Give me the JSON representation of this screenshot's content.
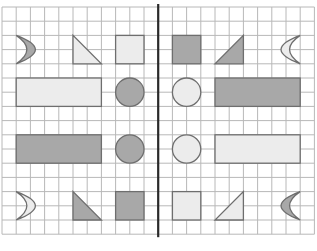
{
  "grid": {
    "x0": 2,
    "y0": 7,
    "cols": 22,
    "rows": 16,
    "cell": 14.2,
    "line_color": "#b8b8b8",
    "divider_color": "#2a2a2a",
    "divider_col": 11
  },
  "colors": {
    "dark_fill": "#a8a8a8",
    "light_fill": "#ececec",
    "stroke": "#6e6e6e"
  },
  "shapes": [
    {
      "type": "crescent-right",
      "col": 1,
      "row": 2,
      "w": 2,
      "h": 2,
      "fill": "dark",
      "name": "crescent-top-left"
    },
    {
      "type": "triangle-topleft",
      "col": 5,
      "row": 2,
      "w": 2,
      "h": 2,
      "fill": "light",
      "name": "triangle-top-left"
    },
    {
      "type": "rect",
      "col": 8,
      "row": 2,
      "w": 2,
      "h": 2,
      "fill": "light",
      "name": "square-top-left"
    },
    {
      "type": "rect",
      "col": 12,
      "row": 2,
      "w": 2,
      "h": 2,
      "fill": "dark",
      "name": "square-top-right"
    },
    {
      "type": "triangle-topright",
      "col": 15,
      "row": 2,
      "w": 2,
      "h": 2,
      "fill": "dark",
      "name": "triangle-top-right"
    },
    {
      "type": "crescent-left",
      "col": 19,
      "row": 2,
      "w": 2,
      "h": 2,
      "fill": "light",
      "name": "crescent-top-right"
    },
    {
      "type": "rect",
      "col": 1,
      "row": 5,
      "w": 6,
      "h": 2,
      "fill": "light",
      "name": "rect-row2-left"
    },
    {
      "type": "circle",
      "col": 8,
      "row": 5,
      "w": 2,
      "h": 2,
      "fill": "dark",
      "name": "circle-row2-left"
    },
    {
      "type": "circle",
      "col": 12,
      "row": 5,
      "w": 2,
      "h": 2,
      "fill": "light",
      "name": "circle-row2-right"
    },
    {
      "type": "rect",
      "col": 15,
      "row": 5,
      "w": 6,
      "h": 2,
      "fill": "dark",
      "name": "rect-row2-right"
    },
    {
      "type": "rect",
      "col": 1,
      "row": 9,
      "w": 6,
      "h": 2,
      "fill": "dark",
      "name": "rect-row3-left"
    },
    {
      "type": "circle",
      "col": 8,
      "row": 9,
      "w": 2,
      "h": 2,
      "fill": "dark",
      "name": "circle-row3-left"
    },
    {
      "type": "circle",
      "col": 12,
      "row": 9,
      "w": 2,
      "h": 2,
      "fill": "light",
      "name": "circle-row3-right"
    },
    {
      "type": "rect",
      "col": 15,
      "row": 9,
      "w": 6,
      "h": 2,
      "fill": "light",
      "name": "rect-row3-right"
    },
    {
      "type": "crescent-right",
      "col": 1,
      "row": 13,
      "w": 2,
      "h": 2,
      "fill": "light",
      "name": "crescent-bottom-left"
    },
    {
      "type": "triangle-bottomleft",
      "col": 5,
      "row": 13,
      "w": 2,
      "h": 2,
      "fill": "dark",
      "name": "triangle-bottom-left"
    },
    {
      "type": "rect",
      "col": 8,
      "row": 13,
      "w": 2,
      "h": 2,
      "fill": "dark",
      "name": "square-bottom-left"
    },
    {
      "type": "rect",
      "col": 12,
      "row": 13,
      "w": 2,
      "h": 2,
      "fill": "light",
      "name": "square-bottom-right"
    },
    {
      "type": "triangle-bottomright",
      "col": 15,
      "row": 13,
      "w": 2,
      "h": 2,
      "fill": "light",
      "name": "triangle-bottom-right"
    },
    {
      "type": "crescent-left",
      "col": 19,
      "row": 13,
      "w": 2,
      "h": 2,
      "fill": "dark",
      "name": "crescent-bottom-right"
    }
  ]
}
